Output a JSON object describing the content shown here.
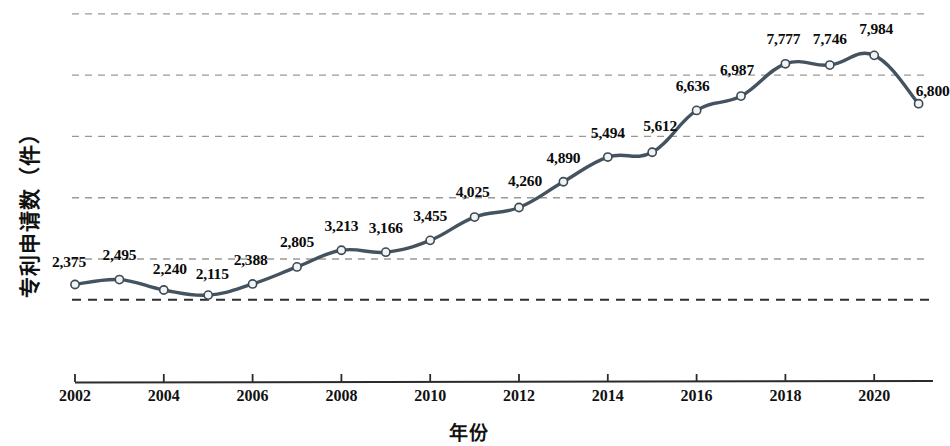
{
  "chart_data": {
    "type": "line",
    "title": "",
    "xlabel": "年份",
    "ylabel": "专利申请数（件）",
    "categories": [
      "2002",
      "2003",
      "2004",
      "2005",
      "2006",
      "2007",
      "2008",
      "2009",
      "2010",
      "2011",
      "2012",
      "2013",
      "2014",
      "2015",
      "2016",
      "2017",
      "2018",
      "2019",
      "2020",
      "2021"
    ],
    "values": [
      2375,
      2495,
      2240,
      2115,
      2388,
      2805,
      3213,
      3166,
      3455,
      4025,
      4260,
      4890,
      5494,
      5612,
      6636,
      6987,
      7777,
      7746,
      7984,
      6800
    ],
    "point_labels": [
      "2,375",
      "2,495",
      "2,240",
      "2,115",
      "2,388",
      "2,805",
      "3,213",
      "3,166",
      "3,455",
      "4,025",
      "4,260",
      "4,890",
      "5,494",
      "5,612",
      "6,636",
      "6,987",
      "7,777",
      "7,746",
      "7,984",
      "6,800"
    ],
    "x_tick_labels": [
      "2002",
      "2004",
      "2006",
      "2008",
      "2010",
      "2012",
      "2014",
      "2016",
      "2018",
      "2020"
    ],
    "x_tick_years": [
      2002,
      2004,
      2006,
      2008,
      2010,
      2012,
      2014,
      2016,
      2018,
      2020
    ],
    "xlim": [
      2002,
      2021
    ],
    "ylim": [
      1500,
      9000
    ],
    "gridlines": [
      2000,
      3000,
      4500,
      6000,
      7500,
      9000
    ],
    "grid": true,
    "legend": "none",
    "marker": "open-circle",
    "colors": {
      "line": "#44535f",
      "marker_fill": "#f2f4f3",
      "marker_stroke": "#3c4a55",
      "grid": "#9a9a95",
      "axis": "#2b2b2b",
      "text": "#111111"
    }
  }
}
